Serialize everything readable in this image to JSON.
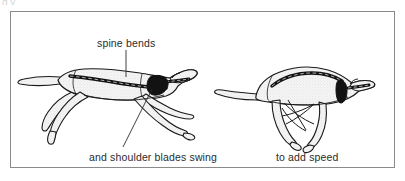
{
  "figure": {
    "type": "anatomical-motion-diagram",
    "frame": {
      "border_color": "#8a8a8a",
      "background": "#ffffff"
    },
    "top_artifact_text": "g  y",
    "labels": {
      "spine_bends": "spine bends",
      "shoulder_blades": "and shoulder blades swing",
      "add_speed": "to add speed"
    },
    "colors": {
      "outline": "#1a1a1a",
      "body_fill": "#f0f0f0",
      "skeleton_dark": "#121212",
      "leader_line": "#2b2b2b",
      "frame": "#8a8a8a"
    },
    "panels": [
      {
        "name": "extended-gallop",
        "description": "cheetah with spine extended and legs stretched fore and aft",
        "spine_state": "extended",
        "leaders": [
          {
            "name": "spine-leader",
            "from": [
              126,
              50
            ],
            "to": [
              126,
              76
            ]
          },
          {
            "name": "scapula-leader",
            "from": [
              152,
              88
            ],
            "to": [
              123,
              146
            ]
          }
        ]
      },
      {
        "name": "gathered-gallop",
        "description": "cheetah with spine arched and legs gathered beneath the body",
        "spine_state": "arched",
        "leaders": []
      }
    ],
    "icons": {
      "vertebra_bead": "vertebra-bead-icon",
      "scapula_blade": "scapula-blade-icon"
    }
  }
}
